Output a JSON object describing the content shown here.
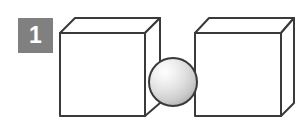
{
  "figure": {
    "label": "Figure panel 1: two cubes with a sphere between them",
    "background_color": "#ffffff",
    "width": 306,
    "height": 128
  },
  "badge": {
    "number": "1",
    "fill_color": "#808080",
    "text_color": "#ffffff",
    "x": 18,
    "y": 18,
    "size": 35
  },
  "objects": {
    "left_cube": {
      "name": "left cube",
      "face_color": "#ffffff",
      "stroke_color": "#3a3a3a",
      "stroke_width": 2,
      "front_x": 60,
      "front_y": 33,
      "front_size": 84,
      "depth_dx": 15,
      "depth_dy": -15
    },
    "right_cube": {
      "name": "right cube",
      "face_color": "#ffffff",
      "stroke_color": "#3a3a3a",
      "stroke_width": 2,
      "front_x": 195,
      "front_y": 33,
      "front_size": 85,
      "depth_dx": 14,
      "depth_dy": -15
    },
    "sphere": {
      "name": "sphere",
      "stroke_color": "#3a3a3a",
      "stroke_width": 2,
      "highlight_color": "#fdfdfd",
      "mid_color": "#dcdcdc",
      "shadow_color": "#b4b4b4",
      "center_x": 173,
      "center_y": 82,
      "radius": 24
    }
  }
}
